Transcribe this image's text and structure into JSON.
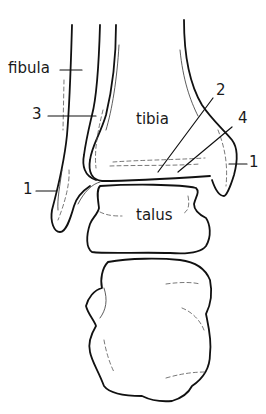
{
  "figure": {
    "line_color": "#111111",
    "background": "#ffffff"
  },
  "labels": {
    "fibula": "fibula",
    "tibia": "tibia",
    "talus": "talus",
    "callout_3": "3",
    "callout_2": "2",
    "callout_4": "4",
    "callout_1_left": "1",
    "callout_1_right": "1"
  }
}
